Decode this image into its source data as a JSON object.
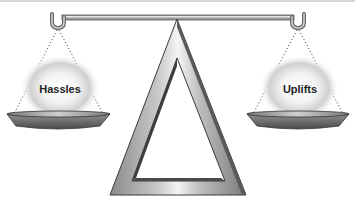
{
  "diagram": {
    "type": "balance-scale",
    "left_pan": {
      "label": "Hassles"
    },
    "right_pan": {
      "label": "Uplifts"
    }
  },
  "colors": {
    "metal_light": "#e8e8e8",
    "metal_mid": "#a8a8a8",
    "metal_dark": "#555555",
    "glow": "#c8c8c8",
    "text": "#222222"
  }
}
